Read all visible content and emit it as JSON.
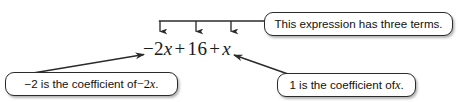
{
  "figure": {
    "expression": {
      "full_text": "-2x + 16 + x",
      "terms": [
        {
          "text": "-2x",
          "coefficient": "-2"
        },
        {
          "text": "16",
          "coefficient": "16"
        },
        {
          "text": "x",
          "coefficient": "1"
        }
      ],
      "parts": {
        "term1_num": "−2",
        "term1_var": "x",
        "plus1": "+",
        "term2": "16",
        "plus2": "+",
        "term3_var": "x"
      }
    },
    "callouts": {
      "terms": {
        "text": "This expression has three terms.",
        "segments": {
          "a": "This expression has three terms."
        }
      },
      "coefficient_neg_two": {
        "text": "−2 is the coefficient of −2x.",
        "segments": {
          "a": "−2 is the coefficient of ",
          "b": "−2",
          "c": "x",
          "d": "."
        }
      },
      "coefficient_one": {
        "text": "1 is the coefficient of x.",
        "segments": {
          "a": "1 is the coefficient of ",
          "b": "x",
          "c": "."
        }
      }
    },
    "colors": {
      "line": "#2b2b2b",
      "box_border": "#2b2b2b",
      "text": "#111111",
      "background": "#ffffff"
    },
    "annotation_count": 3
  }
}
